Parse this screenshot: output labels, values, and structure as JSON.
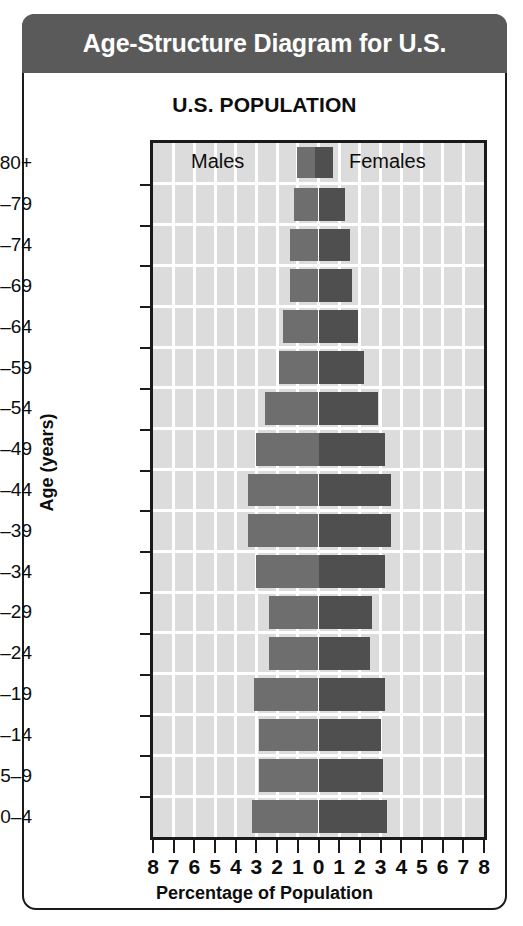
{
  "header": {
    "title": "Age-Structure Diagram for U.S."
  },
  "chart_title": "U.S. POPULATION",
  "legend": {
    "males_label": "Males",
    "females_label": "Females",
    "male_color": "#6e6e6e",
    "female_color": "#4f4f4f"
  },
  "axes": {
    "y_title": "Age (years)",
    "x_title": "Percentage of Population",
    "x_tick_labels": [
      "8",
      "7",
      "6",
      "5",
      "4",
      "3",
      "2",
      "1",
      "0",
      "1",
      "2",
      "3",
      "4",
      "5",
      "6",
      "7",
      "8"
    ]
  },
  "chart_data": {
    "type": "bar",
    "subtype": "population-pyramid",
    "title": "U.S. POPULATION",
    "xlabel": "Percentage of Population",
    "ylabel": "Age (years)",
    "xlim": [
      -8,
      8
    ],
    "x_tick_values": [
      8,
      7,
      6,
      5,
      4,
      3,
      2,
      1,
      0,
      1,
      2,
      3,
      4,
      5,
      6,
      7,
      8
    ],
    "grid": true,
    "legend_position": "top-inside",
    "categories": [
      "80+",
      "75-79",
      "70-74",
      "65-69",
      "60-64",
      "55-59",
      "50-54",
      "45-49",
      "40-44",
      "35-39",
      "30-34",
      "25-29",
      "20-24",
      "15-19",
      "10-14",
      "5-9",
      "0-4"
    ],
    "category_labels": [
      "80+",
      "75–79",
      "70–74",
      "65–69",
      "60–64",
      "55–59",
      "50–54",
      "45–49",
      "40–44",
      "35–39",
      "30–34",
      "25–29",
      "20–24",
      "15–19",
      "10–14",
      "5–9",
      "0–4"
    ],
    "series": [
      {
        "name": "Males",
        "color": "#6e6e6e",
        "side": "left",
        "values": [
          0.0,
          1.2,
          1.4,
          1.4,
          1.7,
          1.9,
          2.6,
          3.0,
          3.4,
          3.4,
          3.0,
          2.4,
          2.4,
          3.1,
          2.9,
          2.9,
          3.2
        ]
      },
      {
        "name": "Females",
        "color": "#4f4f4f",
        "side": "right",
        "values": [
          0.0,
          1.3,
          1.5,
          1.6,
          1.9,
          2.2,
          2.9,
          3.2,
          3.5,
          3.5,
          3.2,
          2.6,
          2.5,
          3.2,
          3.0,
          3.1,
          3.3
        ]
      }
    ]
  }
}
